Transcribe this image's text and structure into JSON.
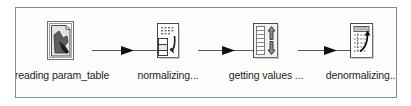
{
  "diagram": {
    "type": "flow-pipeline",
    "orientation": "left-to-right",
    "canvas": {
      "background_color": "#fdfdfd",
      "border_color": "#8a8a8a",
      "grid": "dotted",
      "grid_dot_color": "#bdbdbd"
    },
    "nodes": [
      {
        "id": "reading-param-table",
        "label": "reading param_table",
        "icon": "document-read-icon",
        "icon_description": "page with pointing hand"
      },
      {
        "id": "normalizing",
        "label": "normalizing...",
        "icon": "table-normalize-icon",
        "icon_description": "table sheet with curved down arrow"
      },
      {
        "id": "getting-values",
        "label": "getting values ...",
        "icon": "list-updown-arrows-icon",
        "icon_description": "list with up and down arrows"
      },
      {
        "id": "denormalizing",
        "label": "denormalizing...",
        "icon": "table-denormalize-icon",
        "icon_description": "sheet with dashed rows and curved up arrow"
      }
    ],
    "connectors": [
      {
        "id": "conn-1",
        "from": "reading-param-table",
        "to": "normalizing",
        "arrow": "solid-triangle"
      },
      {
        "id": "conn-2",
        "from": "normalizing",
        "to": "getting-values",
        "arrow": "solid-triangle"
      },
      {
        "id": "conn-3",
        "from": "getting-values",
        "to": "denormalizing",
        "arrow": "solid-triangle"
      }
    ],
    "colors": {
      "line": "#585858",
      "arrow": "#111111",
      "icon_outline": "#4a4a4a",
      "icon_fill": "#ffffff",
      "icon_shade": "#9a9a9a",
      "text": "#1c1c1c"
    }
  }
}
